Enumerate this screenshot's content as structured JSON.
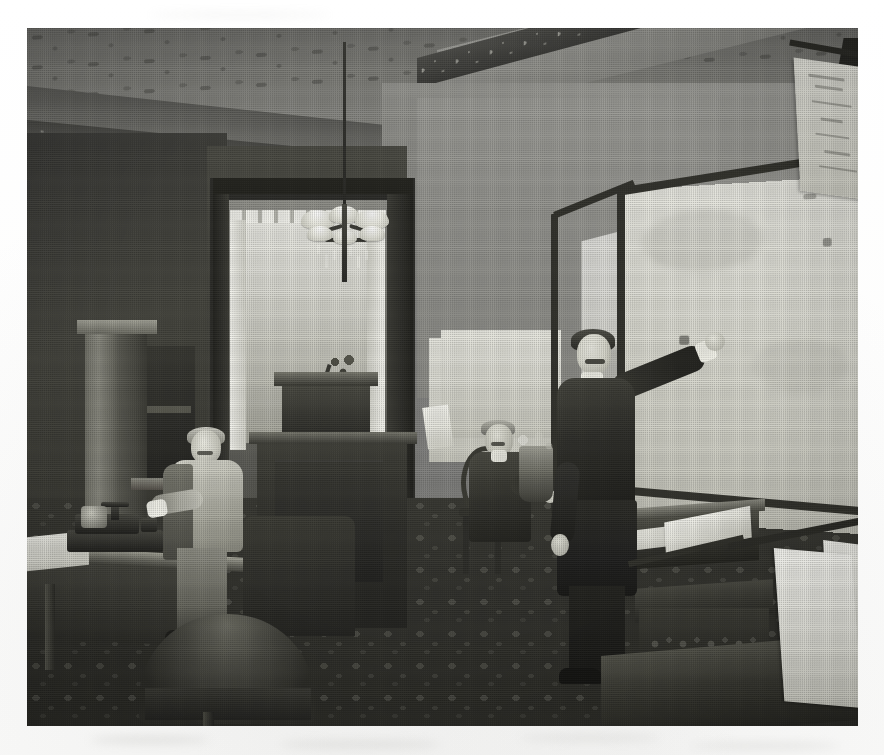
{
  "document": {
    "type": "photograph",
    "medium": "halftone print reproduction",
    "tone": "black-and-white / monochrome",
    "caption": "",
    "scene_title": "Late-nineteenth-century office interior with quotation board",
    "subject_count": 3
  },
  "photo": {
    "frame": {
      "x": 27,
      "y": 28,
      "width": 831,
      "height": 698,
      "background_paper": "#fdfdfc",
      "border": "none"
    },
    "palette": {
      "paper_white": "#fdfdfc",
      "highlight": "#f6f6f0",
      "light_plaster": "#9e9e99",
      "mid_grey": "#8c8c87",
      "wall_shadow": "#46463f",
      "dark_wood": "#2d2d28",
      "deep_shadow": "#191917",
      "board_face": "#e7e7e0",
      "board_frame": "#33332d"
    }
  },
  "scene": {
    "ceiling": {
      "name": "Ornamented plaster ceiling",
      "pattern": "repeating foliate medallions",
      "tone": "#7d7d78"
    },
    "cornice": {
      "name": "Carved frieze / cornice band",
      "pattern": "dense scrollwork",
      "tone": "#4a4a46"
    },
    "chandelier": {
      "name": "Six-arm gas chandelier",
      "shade_count": 6,
      "shade_color": "#ebebe2",
      "has_prisms": true
    },
    "doorway": {
      "name": "Open doorway with sash window beyond",
      "curtain": "lace panel",
      "valance": true
    },
    "quotation_board": {
      "name": "Large framed quotation board",
      "panel_count": 2,
      "frame_color": "#33332d",
      "surface_color": "#e7e7e0",
      "chalk_marks": [
        "illegible",
        "faint figures",
        "smudged column"
      ]
    },
    "hanging_map": {
      "name": "Rolled wall chart on rod",
      "position": "upper right",
      "paper_color": "#e4e4dc"
    },
    "floor": {
      "name": "Patterned carpet",
      "pattern": "allover medallion repeat",
      "tone": "#32322d"
    },
    "furniture": [
      {
        "name": "tall glazed cabinet",
        "position": "far left"
      },
      {
        "name": "writing desk with ticker",
        "position": "left foreground"
      },
      {
        "name": "upholstered armchair",
        "position": "left foreground"
      },
      {
        "name": "tall standing desk",
        "position": "center"
      },
      {
        "name": "bentwood side chair",
        "position": "center right"
      },
      {
        "name": "ledger desk with open book",
        "position": "right of center"
      },
      {
        "name": "carved low chair",
        "position": "right"
      },
      {
        "name": "slant-top table with sheets",
        "position": "right foreground"
      }
    ],
    "equipment": [
      {
        "name": "stock ticker / telegraph instrument",
        "position": "left desk"
      },
      {
        "name": "shaded desk lamp",
        "position": "doorway"
      },
      {
        "name": "open ledger book",
        "position": "right desk"
      },
      {
        "name": "flower vase",
        "position": "beside seated man"
      }
    ]
  },
  "figures": [
    {
      "id": "man-left",
      "label": "Clerk standing at the ticker desk",
      "pose": "standing, leaning toward desk",
      "dress": "light waistcoat and shirtsleeves, dark coat",
      "facial_hair": "moustache"
    },
    {
      "id": "man-center",
      "label": "Clerk seated in bentwood chair",
      "pose": "seated, turned three-quarters",
      "dress": "dark suit with white collar",
      "facial_hair": "moustache"
    },
    {
      "id": "man-right",
      "label": "Board marker posting quotations",
      "pose": "standing, right arm raised to the board",
      "dress": "dark frock coat, white cuff and collar",
      "facial_hair": "moustache"
    }
  ],
  "board_text": {
    "note": "chalk inscriptions are illegible in the print",
    "lines": [
      "",
      "",
      ""
    ]
  }
}
